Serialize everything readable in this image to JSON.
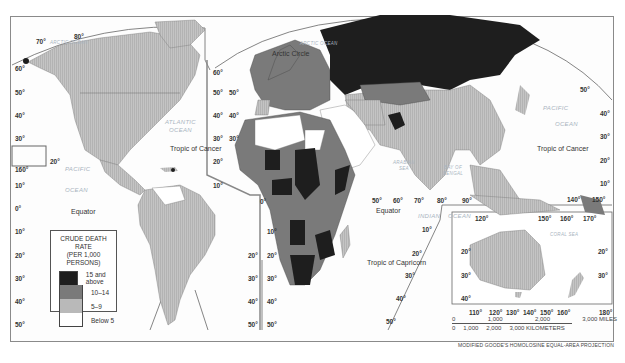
{
  "map": {
    "projection": "MODIFIED GOODE'S HOMOLOSINE EQUAL-AREA PROJECTION",
    "legend": {
      "title_line1": "CRUDE DEATH RATE",
      "title_line2": "(PER 1,000 PERSONS)",
      "items": [
        {
          "label": "15 and above",
          "color": "#1e1e1e"
        },
        {
          "label": "10–14",
          "color": "#7a7a7a"
        },
        {
          "label": "5–9",
          "color": "#b9b9b9"
        },
        {
          "label": "Below 5",
          "color": "#ffffff"
        }
      ]
    },
    "scale": {
      "miles": [
        "0",
        "1,000",
        "2,000",
        "3,000 MILES"
      ],
      "kilometers": [
        "0",
        "1,000",
        "2,000",
        "3,000 KILOMETERS"
      ]
    },
    "oceans": {
      "arctic_left": "ARCTIC OCEAN",
      "arctic_center": "ARCTIC OCEAN",
      "atlantic": "ATLANTIC\nOCEAN",
      "pacific_left_1": "PACIFIC",
      "pacific_left_2": "OCEAN",
      "pacific_right_1": "PACIFIC",
      "pacific_right_2": "OCEAN",
      "indian_1": "INDIAN",
      "indian_2": "OCEAN",
      "arabian_sea": "ARABIAN\nSEA",
      "bay_of_bengal": "BAY OF\nBENGAL",
      "coral_sea": "CORAL SEA"
    },
    "lines": {
      "arctic_circle": "Arctic Circle",
      "tropic_cancer_left": "Tropic of Cancer",
      "tropic_cancer_right": "Tropic of Cancer",
      "equator_left": "Equator",
      "equator_right": "Equator",
      "tropic_capricorn": "Tropic of Capricorn"
    },
    "labels": {
      "left_lats": [
        "60°",
        "50°",
        "40°",
        "30°",
        "20°",
        "10°",
        "0°",
        "10°",
        "20°",
        "30°",
        "40°",
        "50°"
      ],
      "top_70": "70°",
      "top_80": "80°",
      "inset_160": "160°",
      "mid_lats_a": [
        "60°",
        "50°",
        "40°",
        "30°",
        "20°",
        "10°"
      ],
      "mid_lats_b": [
        "50°",
        "40°",
        "30°"
      ],
      "sa_right_lats": [
        "20°",
        "30°",
        "40°",
        "50°"
      ],
      "africa_left_lats": [
        "10°",
        "20°",
        "30°",
        "40°",
        "50°"
      ],
      "zero": "0°",
      "lon_row": [
        "50°",
        "60°",
        "70°",
        "80°",
        "90°"
      ],
      "indian_lats": [
        "10°",
        "20°",
        "30°",
        "40°",
        "50°"
      ],
      "right_lats": [
        "50°",
        "40°",
        "30°",
        "20°",
        "10°"
      ],
      "right_lons": [
        "140°",
        "150°"
      ],
      "aus_top_lons": [
        "120°",
        "150°",
        "160°",
        "170°"
      ],
      "aus_left_lats": [
        "20°",
        "30°",
        "40°"
      ],
      "aus_right_lats": [
        "20°",
        "30°"
      ],
      "aus_bottom_lons": [
        "110°",
        "120°",
        "130°",
        "140°",
        "150°",
        "160°",
        "180°"
      ]
    }
  }
}
